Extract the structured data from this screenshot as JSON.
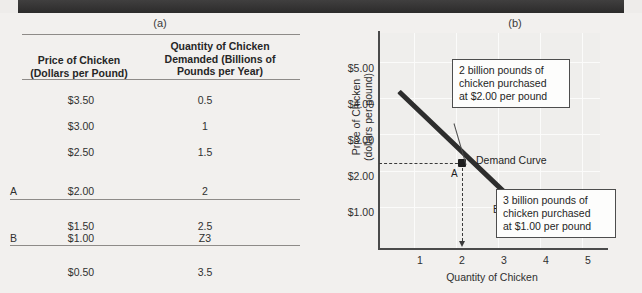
{
  "panels": {
    "a_label": "(a)",
    "b_label": "(b)"
  },
  "table": {
    "headers": {
      "marker": "",
      "price": "Price of Chicken\n(Dollars per Pound)",
      "price_line1": "Price of Chicken",
      "price_line2": "(Dollars per Pound)",
      "quantity_line1": "Quantity of Chicken",
      "quantity_line2": "Demanded (Billions of",
      "quantity_line3": "Pounds per Year)"
    },
    "rows": [
      {
        "marker": "",
        "price": "$3.50",
        "quantity": "0.5"
      },
      {
        "marker": "",
        "price": "$3.00",
        "quantity": "1"
      },
      {
        "marker": "",
        "price": "$2.50",
        "quantity": "1.5"
      },
      {
        "marker": "A",
        "price": "$2.00",
        "quantity": "2"
      },
      {
        "marker": "",
        "price": "$1.50",
        "quantity": "2.5"
      },
      {
        "marker": "B",
        "price": "$1.00",
        "quantity": "Z3"
      },
      {
        "marker": "",
        "price": "$0.50",
        "quantity": "3.5"
      }
    ]
  },
  "chart_data": {
    "type": "line",
    "title": "",
    "xlabel": "Quantity of Chicken",
    "ylabel_line1": "Price of Chicken",
    "ylabel_line2": "(dollars per pound)",
    "xticks": [
      "1",
      "2",
      "3",
      "4",
      "5"
    ],
    "xtick_values": [
      1,
      2,
      3,
      4,
      5
    ],
    "yticks": [
      "$1.00",
      "$2.00",
      "$3.00",
      "$4.00",
      "$5.00"
    ],
    "ytick_values": [
      1,
      2,
      3,
      4,
      5
    ],
    "xlim": [
      0,
      5.6
    ],
    "ylim": [
      0,
      5.6
    ],
    "grid": true,
    "series": [
      {
        "name": "Demand Curve",
        "x": [
          0.5,
          4.0
        ],
        "y": [
          4.0,
          0.1
        ]
      }
    ],
    "points": [
      {
        "label": "A",
        "x": 2,
        "y": 2
      },
      {
        "label": "B",
        "x": 3,
        "y": 1
      }
    ],
    "curve_label": "Demand Curve",
    "annotations": [
      {
        "id": "callout-a",
        "text": "2 billion pounds of chicken purchased at $2.00 per pound",
        "line1": "2 billion pounds of",
        "line2": "chicken purchased",
        "line3": "at $2.00 per pound",
        "points_to": "A"
      },
      {
        "id": "callout-b",
        "text": "3 billion pounds of chicken purchased at $1.00 per pound",
        "line1": "3 billion pounds of",
        "line2": "chicken purchased",
        "line3": "at $1.00 per pound",
        "points_to": "B"
      }
    ],
    "colors": {
      "curve": "#2d2d2d",
      "plot_background": "#efeeec",
      "gridline": "#fbfbfa",
      "axis": "#4a4a4a",
      "guide": "#3a3a3a"
    }
  }
}
